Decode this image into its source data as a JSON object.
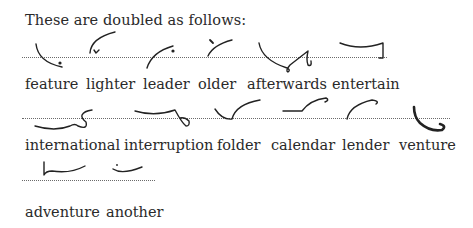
{
  "title": "These are doubled as follows:",
  "rows": [
    {
      "words": [
        "feature",
        "lighter",
        "leader",
        "older",
        "afterwards",
        "entertain"
      ]
    },
    {
      "words": [
        "international",
        "interruption",
        "folder",
        "calendar",
        "lender",
        "venture"
      ]
    },
    {
      "words": [
        "adventure",
        "another"
      ]
    }
  ],
  "outlines": [
    {
      "word": "feature",
      "icon": "shorthand-outline-feature"
    },
    {
      "word": "lighter",
      "icon": "shorthand-outline-lighter"
    },
    {
      "word": "leader",
      "icon": "shorthand-outline-leader"
    },
    {
      "word": "older",
      "icon": "shorthand-outline-older"
    },
    {
      "word": "afterwards",
      "icon": "shorthand-outline-afterwards"
    },
    {
      "word": "entertain",
      "icon": "shorthand-outline-entertain"
    },
    {
      "word": "international",
      "icon": "shorthand-outline-international"
    },
    {
      "word": "interruption",
      "icon": "shorthand-outline-interruption"
    },
    {
      "word": "folder",
      "icon": "shorthand-outline-folder"
    },
    {
      "word": "calendar",
      "icon": "shorthand-outline-calendar"
    },
    {
      "word": "lender",
      "icon": "shorthand-outline-lender"
    },
    {
      "word": "venture",
      "icon": "shorthand-outline-venture"
    },
    {
      "word": "adventure",
      "icon": "shorthand-outline-adventure"
    },
    {
      "word": "another",
      "icon": "shorthand-outline-another"
    }
  ]
}
